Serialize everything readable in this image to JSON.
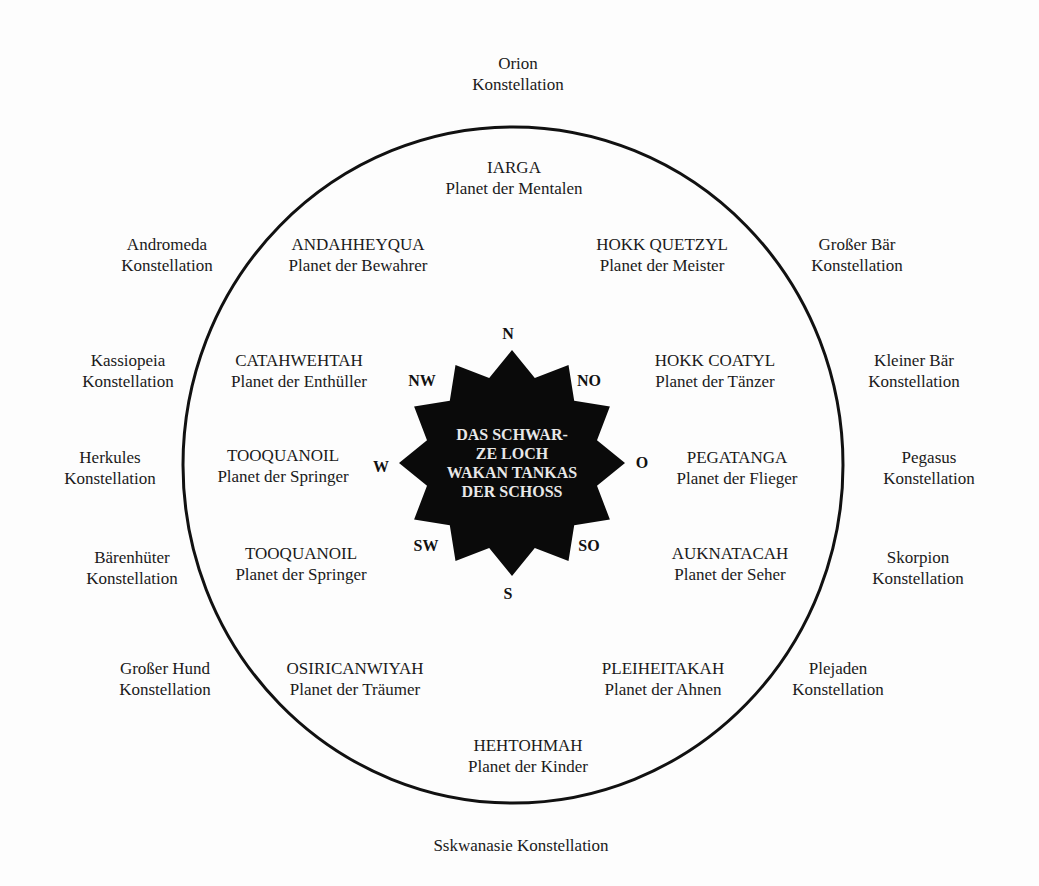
{
  "diagram": {
    "center": {
      "lines": [
        "DAS SCHWAR-",
        "ZE LOCH",
        "WAKAN TANKAS",
        "DER SCHOSS"
      ]
    },
    "directions": {
      "N": "N",
      "NO": "NO",
      "O": "O",
      "SO": "SO",
      "S": "S",
      "SW": "SW",
      "W": "W",
      "NW": "NW"
    },
    "planets": [
      {
        "name": "IARGA",
        "desc": "Planet der Mentalen"
      },
      {
        "name": "HOKK QUETZYL",
        "desc": "Planet der Meister"
      },
      {
        "name": "HOKK COATYL",
        "desc": "Planet der Tänzer"
      },
      {
        "name": "PEGATANGA",
        "desc": "Planet der Flieger"
      },
      {
        "name": "AUKNATACAH",
        "desc": "Planet der Seher"
      },
      {
        "name": "PLEIHEITAKAH",
        "desc": "Planet der Ahnen"
      },
      {
        "name": "HEHTOHMAH",
        "desc": "Planet der Kinder"
      },
      {
        "name": "OSIRICANWIYAH",
        "desc": "Planet der Träumer"
      },
      {
        "name": "TOOQUANOIL",
        "desc": "Planet der Springer"
      },
      {
        "name": "TOOQUANOIL",
        "desc": "Planet der Springer"
      },
      {
        "name": "CATAHWEHTAH",
        "desc": "Planet der Enthüller"
      },
      {
        "name": "ANDAHHEYQUA",
        "desc": "Planet der Bewahrer"
      }
    ],
    "constellations": [
      {
        "name": "Orion",
        "desc": "Konstellation"
      },
      {
        "name": "Großer Bär",
        "desc": "Konstellation"
      },
      {
        "name": "Kleiner Bär",
        "desc": "Konstellation"
      },
      {
        "name": "Pegasus",
        "desc": "Konstellation"
      },
      {
        "name": "Skorpion",
        "desc": "Konstellation"
      },
      {
        "name": "Plejaden",
        "desc": "Konstellation"
      },
      {
        "name": "Sskwanasie Konstellation",
        "desc": ""
      },
      {
        "name": "Großer Hund",
        "desc": "Konstellation"
      },
      {
        "name": "Bärenhüter",
        "desc": "Konstellation"
      },
      {
        "name": "Herkules",
        "desc": "Konstellation"
      },
      {
        "name": "Kassiopeia",
        "desc": "Konstellation"
      },
      {
        "name": "Andromeda",
        "desc": "Konstellation"
      }
    ]
  }
}
